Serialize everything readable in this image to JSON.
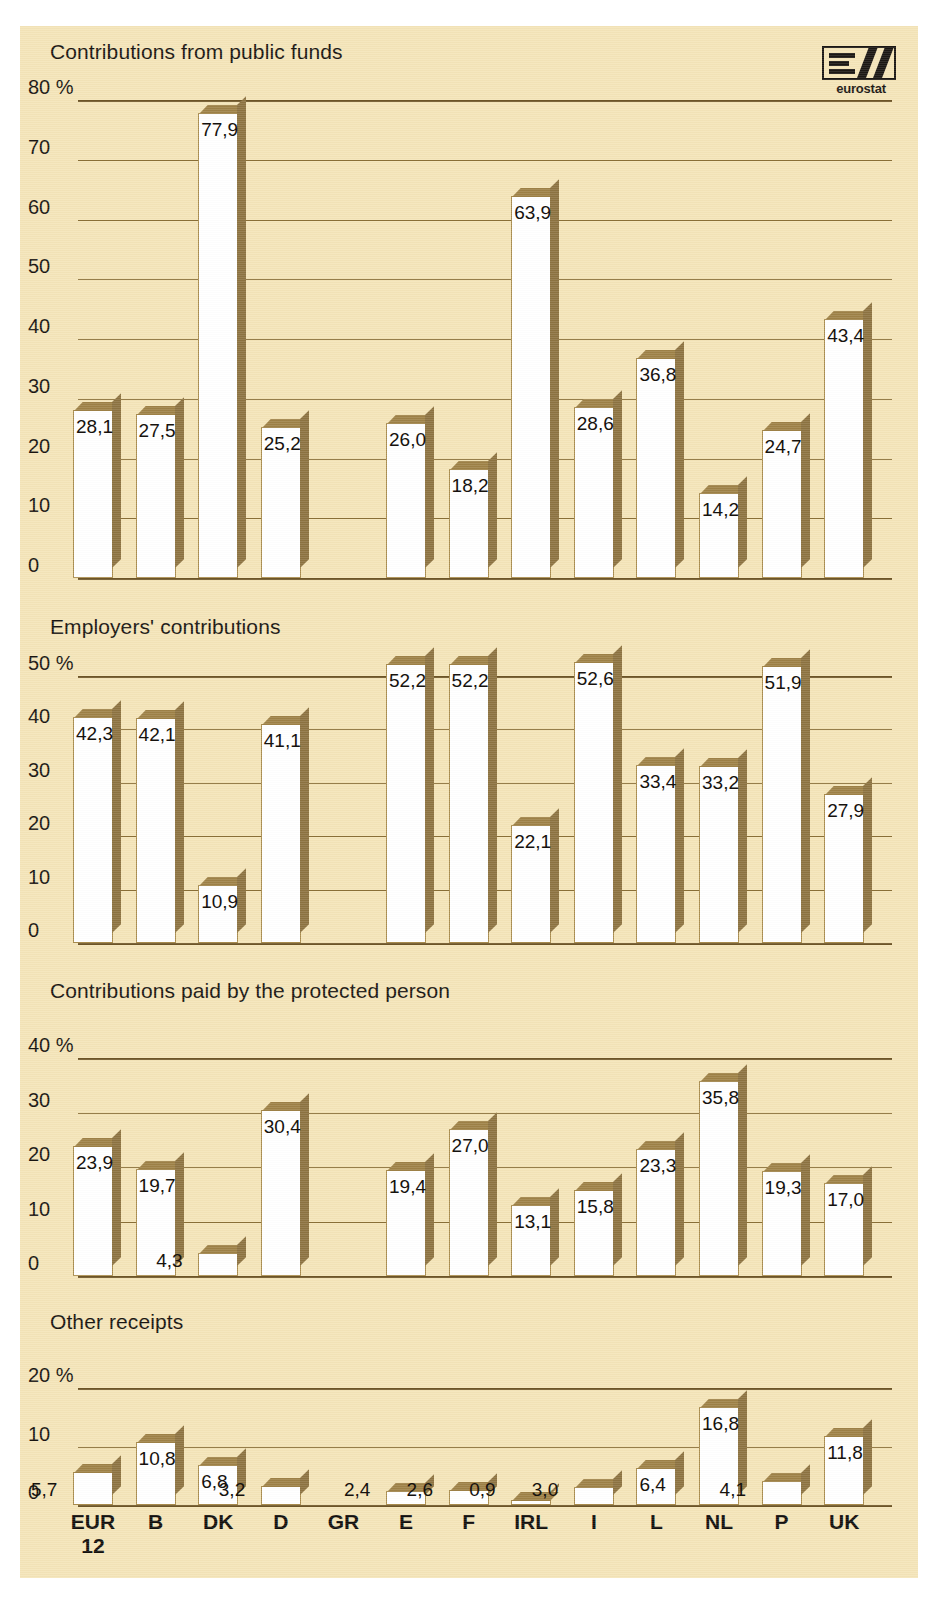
{
  "logo": {
    "name": "eurostat-logo",
    "word": "eurostat"
  },
  "axis": {
    "categories": [
      "EUR 12",
      "B",
      "DK",
      "D",
      "GR",
      "E",
      "F",
      "IRL",
      "I",
      "L",
      "NL",
      "P",
      "UK"
    ],
    "categories_display": [
      [
        "EUR",
        "12"
      ],
      [
        "B"
      ],
      [
        "DK"
      ],
      [
        "D"
      ],
      [
        "GR"
      ],
      [
        "E"
      ],
      [
        "F"
      ],
      [
        "IRL"
      ],
      [
        "I"
      ],
      [
        "L"
      ],
      [
        "NL"
      ],
      [
        "P"
      ],
      [
        "UK"
      ]
    ]
  },
  "chart_data": [
    {
      "type": "bar",
      "title": "Contributions from public funds",
      "xlabel": "",
      "ylabel": "%",
      "ylim": [
        0,
        80
      ],
      "yticks": [
        0,
        10,
        20,
        30,
        40,
        50,
        60,
        70,
        80
      ],
      "ytick_labels": [
        "0",
        "10",
        "20",
        "30",
        "40",
        "50",
        "60",
        "70",
        "80 %"
      ],
      "grid": true,
      "categories": [
        "EUR 12",
        "B",
        "DK",
        "D",
        "GR",
        "E",
        "F",
        "IRL",
        "I",
        "L",
        "NL",
        "P",
        "UK"
      ],
      "values": [
        28.1,
        27.5,
        77.9,
        25.2,
        null,
        26.0,
        18.2,
        63.9,
        28.6,
        36.8,
        14.2,
        24.7,
        43.4
      ],
      "value_labels": [
        "28,1",
        "27,5",
        "77,9",
        "25,2",
        "",
        "26,0",
        "18,2",
        "63,9",
        "28,6",
        "36,8",
        "14,2",
        "24,7",
        "43,4"
      ]
    },
    {
      "type": "bar",
      "title": "Employers' contributions",
      "xlabel": "",
      "ylabel": "%",
      "ylim": [
        0,
        50
      ],
      "yticks": [
        0,
        10,
        20,
        30,
        40,
        50
      ],
      "ytick_labels": [
        "0",
        "10",
        "20",
        "30",
        "40",
        "50 %"
      ],
      "grid": true,
      "categories": [
        "EUR 12",
        "B",
        "DK",
        "D",
        "GR",
        "E",
        "F",
        "IRL",
        "I",
        "L",
        "NL",
        "P",
        "UK"
      ],
      "values": [
        42.3,
        42.1,
        10.9,
        41.1,
        null,
        52.2,
        52.2,
        22.1,
        52.6,
        33.4,
        33.2,
        51.9,
        27.9
      ],
      "value_labels": [
        "42,3",
        "42,1",
        "10,9",
        "41,1",
        "",
        "52,2",
        "52,2",
        "22,1",
        "52,6",
        "33,4",
        "33,2",
        "51,9",
        "27,9"
      ]
    },
    {
      "type": "bar",
      "title": "Contributions paid by the protected person",
      "xlabel": "",
      "ylabel": "%",
      "ylim": [
        0,
        40
      ],
      "yticks": [
        0,
        10,
        20,
        30,
        40
      ],
      "ytick_labels": [
        "0",
        "10",
        "20",
        "30",
        "40 %"
      ],
      "grid": true,
      "categories": [
        "EUR 12",
        "B",
        "DK",
        "D",
        "GR",
        "E",
        "F",
        "IRL",
        "I",
        "L",
        "NL",
        "P",
        "UK"
      ],
      "values": [
        23.9,
        19.7,
        4.3,
        30.4,
        null,
        19.4,
        27.0,
        13.1,
        15.8,
        23.3,
        35.8,
        19.3,
        17.0
      ],
      "value_labels": [
        "23,9",
        "19,7",
        "4,3",
        "30,4",
        "",
        "19,4",
        "27,0",
        "13,1",
        "15,8",
        "23,3",
        "35,8",
        "19,3",
        "17,0"
      ]
    },
    {
      "type": "bar",
      "title": "Other receipts",
      "xlabel": "",
      "ylabel": "%",
      "ylim": [
        0,
        20
      ],
      "yticks": [
        0,
        10,
        20
      ],
      "ytick_labels": [
        "0",
        "10",
        "20 %"
      ],
      "grid": true,
      "categories": [
        "EUR 12",
        "B",
        "DK",
        "D",
        "GR",
        "E",
        "F",
        "IRL",
        "I",
        "L",
        "NL",
        "P",
        "UK"
      ],
      "values": [
        5.7,
        10.8,
        6.8,
        3.2,
        null,
        2.4,
        2.6,
        0.9,
        3.0,
        6.4,
        16.8,
        4.1,
        11.8
      ],
      "value_labels": [
        "5,7",
        "10,8",
        "6,8",
        "3,2",
        "",
        "2,4",
        "2,6",
        "0,9",
        "3,0",
        "6,4",
        "16,8",
        "4,1",
        "11,8"
      ]
    }
  ],
  "colors": {
    "paper": "#f4e4b8",
    "bar_face": "#ffffff",
    "bar_shadow": "#8d7341",
    "gridline": "#8a6f37",
    "text": "#181410"
  }
}
